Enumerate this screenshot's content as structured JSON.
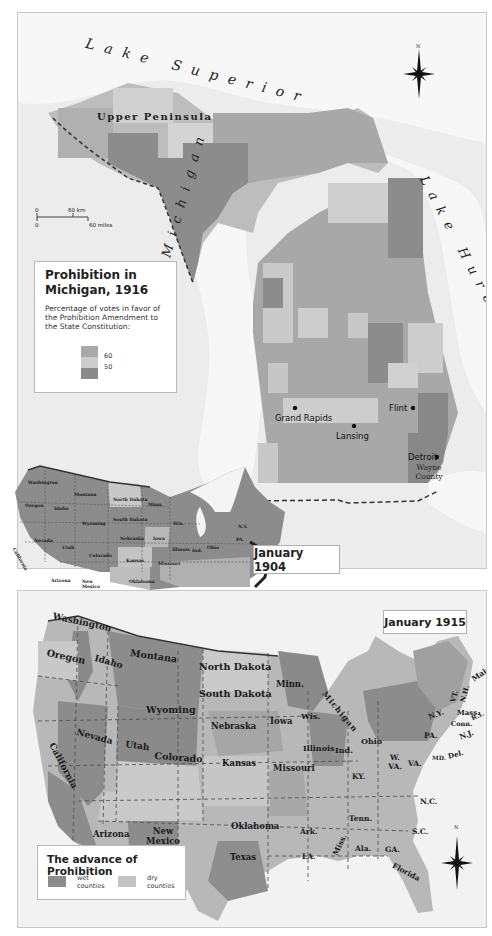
{
  "michigan_map": {
    "lakes": {
      "superior": "Lake Superior",
      "michigan": "Lake Michigan",
      "huron": "Lake Huron"
    },
    "region_label": "Upper Peninsula",
    "cities": [
      {
        "name": "Grand Rapids"
      },
      {
        "name": "Lansing"
      },
      {
        "name": "Flint"
      },
      {
        "name": "Detroit"
      }
    ],
    "county_label": "Wayne County",
    "scale": {
      "km_zero": "0",
      "km_label": "60 km",
      "mi_zero": "0",
      "mi_label": "60 miles"
    },
    "compass": "N",
    "legend": {
      "title": "Prohibition in Michigan, 1916",
      "description": "Percentage of votes in favor of the Prohibition Amendment to the State Constitution:",
      "ticks": [
        "60",
        "50"
      ],
      "colors": {
        "high": "#a8a8a8",
        "mid": "#cccccc",
        "low": "#8a8a8a"
      }
    }
  },
  "us_1904_map": {
    "date_label": "January 1904",
    "states": [
      "Washington",
      "Montana",
      "North Dakota",
      "Minn.",
      "Oregon",
      "Idaho",
      "South Dakota",
      "Wyoming",
      "Wis.",
      "Nebraska",
      "Iowa",
      "Nevada",
      "Utah",
      "Colorado",
      "Kansas",
      "California",
      "Illinois",
      "Ind.",
      "Ohio",
      "Missouri",
      "Arizona",
      "New Mexico",
      "Oklahoma",
      "Ark.",
      "Tenn.",
      "Texas",
      "LA.",
      "GA.",
      "N.Y.",
      "PA."
    ]
  },
  "us_1915_map": {
    "date_label": "January 1915",
    "compass": "N",
    "states": [
      {
        "name": "Washington"
      },
      {
        "name": "Montana"
      },
      {
        "name": "North Dakota"
      },
      {
        "name": "Minn."
      },
      {
        "name": "Oregon"
      },
      {
        "name": "Idaho"
      },
      {
        "name": "South Dakota"
      },
      {
        "name": "Wyoming"
      },
      {
        "name": "Wis."
      },
      {
        "name": "Michigan"
      },
      {
        "name": "Nebraska"
      },
      {
        "name": "Iowa"
      },
      {
        "name": "Nevada"
      },
      {
        "name": "Utah"
      },
      {
        "name": "Colorado"
      },
      {
        "name": "Illinois"
      },
      {
        "name": "Ind."
      },
      {
        "name": "Ohio"
      },
      {
        "name": "California"
      },
      {
        "name": "Kansas"
      },
      {
        "name": "Missouri"
      },
      {
        "name": "KY."
      },
      {
        "name": "W. VA."
      },
      {
        "name": "VA."
      },
      {
        "name": "Arizona"
      },
      {
        "name": "New Mexico"
      },
      {
        "name": "Oklahoma"
      },
      {
        "name": "Tenn."
      },
      {
        "name": "N.C."
      },
      {
        "name": "Ark."
      },
      {
        "name": "S.C."
      },
      {
        "name": "Miss."
      },
      {
        "name": "Ala."
      },
      {
        "name": "GA."
      },
      {
        "name": "LA."
      },
      {
        "name": "Texas"
      },
      {
        "name": "Florida"
      },
      {
        "name": "N.Y."
      },
      {
        "name": "PA."
      },
      {
        "name": "N.J."
      },
      {
        "name": "MD."
      },
      {
        "name": "Del."
      },
      {
        "name": "Mass."
      },
      {
        "name": "Conn."
      },
      {
        "name": "R.I."
      },
      {
        "name": "VT."
      },
      {
        "name": "N.H."
      },
      {
        "name": "Maine"
      }
    ],
    "legend": {
      "title": "The advance of Prohibition",
      "wet_label": "wet counties",
      "dry_label": "dry counties",
      "wet_color": "#8c8c8c",
      "dry_color": "#c4c4c4"
    }
  }
}
